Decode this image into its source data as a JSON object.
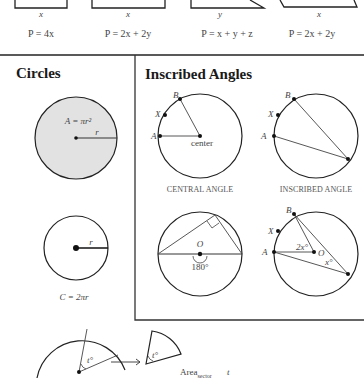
{
  "perimeters": [
    {
      "shape": "square",
      "side_label": "x",
      "formula": "P = 4x"
    },
    {
      "shape": "rectangle",
      "side_label": "x",
      "formula": "P = 2x + 2y"
    },
    {
      "shape": "triangle",
      "side_label": "y",
      "formula": "P = x + y + z"
    },
    {
      "shape": "parallelogram",
      "side_label": "x",
      "formula": "P = 2x + 2y"
    }
  ],
  "circles": {
    "heading": "Circles",
    "area_formula": "A = πr²",
    "radius_label": "r",
    "circumference_formula": "C = 2πr"
  },
  "inscribed": {
    "heading": "Inscribed Angles",
    "central": {
      "points": [
        "B",
        "X",
        "A"
      ],
      "center_label": "center",
      "caption": "CENTRAL ANGLE"
    },
    "inscribed": {
      "points": [
        "B",
        "X",
        "A"
      ],
      "caption": "INSCRIBED ANGLE"
    },
    "semicircle": {
      "center_label": "O",
      "angle_label": "180°"
    },
    "relation": {
      "points": [
        "B",
        "X",
        "A"
      ],
      "center_label": "O",
      "central_angle": "2x°",
      "inscribed_angle": "x°"
    }
  },
  "sector": {
    "angle_label": "t°",
    "center_label": "O",
    "area_label": "Area",
    "area_subscript": "sector",
    "trailing": "t"
  }
}
